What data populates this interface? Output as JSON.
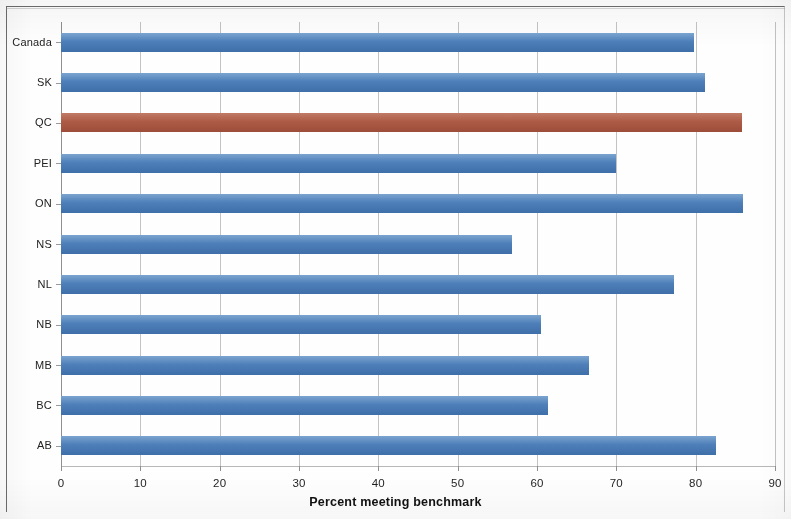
{
  "chart_data": {
    "type": "bar",
    "orientation": "horizontal",
    "title": "",
    "xlabel": "Percent meeting benchmark",
    "ylabel": "",
    "xlim": [
      0,
      90
    ],
    "xticks": [
      "0",
      "10",
      "20",
      "30",
      "40",
      "50",
      "60",
      "70",
      "80",
      "90"
    ],
    "grid": "vertical",
    "legend": "none",
    "categories": [
      "Canada",
      "SK",
      "QC",
      "PEI",
      "ON",
      "NS",
      "NL",
      "NB",
      "MB",
      "BC",
      "AB"
    ],
    "values": [
      79.8,
      81.2,
      85.8,
      70.0,
      86.0,
      56.8,
      77.3,
      60.5,
      66.6,
      61.4,
      82.6
    ],
    "bar_colors": [
      "#4e7fb9",
      "#4e7fb9",
      "#ad5b46",
      "#4e7fb9",
      "#4e7fb9",
      "#4e7fb9",
      "#4e7fb9",
      "#4e7fb9",
      "#4e7fb9",
      "#4e7fb9",
      "#4e7fb9"
    ],
    "highlight_category": "QC",
    "colors": {
      "bar_default": "#4e7fb9",
      "bar_highlight": "#ad5b46",
      "gridline": "#b9b9b9",
      "axis": "#8f8f8f",
      "background": "#ffffff",
      "text": "#1a1a1a"
    }
  },
  "axis": {
    "x_title": "Percent meeting benchmark",
    "x_tick_labels": [
      "0",
      "10",
      "20",
      "30",
      "40",
      "50",
      "60",
      "70",
      "80",
      "90"
    ],
    "category_labels": [
      "Canada",
      "SK",
      "QC",
      "PEI",
      "ON",
      "NS",
      "NL",
      "NB",
      "MB",
      "BC",
      "AB"
    ]
  }
}
